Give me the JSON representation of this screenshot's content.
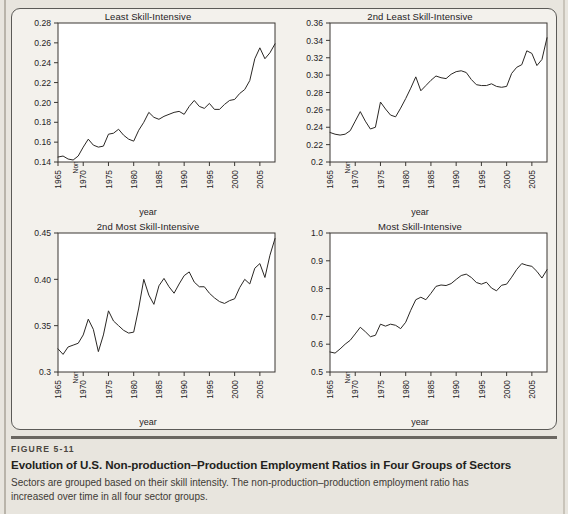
{
  "figure": {
    "number_label": "FIGURE 5-11",
    "title": "Evolution of U.S. Non-production–Production Employment Ratios in Four Groups of Sectors",
    "description": "Sectors are grouped based on their skill intensity. The non-production–production employment ratio has increased over time in all four sector groups."
  },
  "colors": {
    "page_background": "#e8e5de",
    "panel_background": "#f3f1ec",
    "plot_background": "#ffffff",
    "line": "#2a2724",
    "axis": "#3a3733",
    "rule": "#6a6660"
  },
  "shared": {
    "xlabel": "year",
    "ylabel": "Non-production–Production Employment",
    "xtick_labels": [
      "1965",
      "1970",
      "1975",
      "1980",
      "1985",
      "1990",
      "1995",
      "2000",
      "2005"
    ],
    "xtick_values": [
      1965,
      1970,
      1975,
      1980,
      1985,
      1990,
      1995,
      2000,
      2005
    ],
    "xlim": [
      1965,
      2008
    ]
  },
  "chart_data": [
    {
      "type": "line",
      "panel": "top-left",
      "title": "Least Skill-Intensive",
      "xlabel": "year",
      "ylabel": "Non-production–Production Employment",
      "xlim": [
        1965,
        2008
      ],
      "ylim": [
        0.14,
        0.28
      ],
      "ytick_labels": [
        "0.14",
        "0.16",
        "0.18",
        "0.20",
        "0.22",
        "0.24",
        "0.26",
        "0.28"
      ],
      "ytick_values": [
        0.14,
        0.16,
        0.18,
        0.2,
        0.22,
        0.24,
        0.26,
        0.28
      ],
      "grid": false,
      "legend": "none",
      "x": [
        1965,
        1966,
        1967,
        1968,
        1969,
        1970,
        1971,
        1972,
        1973,
        1974,
        1975,
        1976,
        1977,
        1978,
        1979,
        1980,
        1981,
        1982,
        1983,
        1984,
        1985,
        1986,
        1987,
        1988,
        1989,
        1990,
        1991,
        1992,
        1993,
        1994,
        1995,
        1996,
        1997,
        1998,
        1999,
        2000,
        2001,
        2002,
        2003,
        2004,
        2005,
        2006,
        2007,
        2008
      ],
      "values": [
        0.145,
        0.146,
        0.143,
        0.142,
        0.146,
        0.155,
        0.163,
        0.157,
        0.155,
        0.156,
        0.168,
        0.169,
        0.173,
        0.167,
        0.163,
        0.161,
        0.172,
        0.18,
        0.19,
        0.185,
        0.183,
        0.186,
        0.188,
        0.19,
        0.191,
        0.188,
        0.196,
        0.202,
        0.196,
        0.194,
        0.199,
        0.193,
        0.193,
        0.198,
        0.202,
        0.203,
        0.209,
        0.213,
        0.222,
        0.244,
        0.255,
        0.244,
        0.25,
        0.259
      ]
    },
    {
      "type": "line",
      "panel": "top-right",
      "title": "2nd Least Skill-Intensive",
      "xlabel": "year",
      "ylabel": "Non-production–Production Employment",
      "xlim": [
        1965,
        2008
      ],
      "ylim": [
        0.2,
        0.36
      ],
      "ytick_labels": [
        "0.2",
        "0.22",
        "0.24",
        "0.26",
        "0.28",
        "0.30",
        "0.32",
        "0.34",
        "0.36"
      ],
      "ytick_values": [
        0.2,
        0.22,
        0.24,
        0.26,
        0.28,
        0.3,
        0.32,
        0.34,
        0.36
      ],
      "grid": false,
      "legend": "none",
      "x": [
        1965,
        1966,
        1967,
        1968,
        1969,
        1970,
        1971,
        1972,
        1973,
        1974,
        1975,
        1976,
        1977,
        1978,
        1979,
        1980,
        1981,
        1982,
        1983,
        1984,
        1985,
        1986,
        1987,
        1988,
        1989,
        1990,
        1991,
        1992,
        1993,
        1994,
        1995,
        1996,
        1997,
        1998,
        1999,
        2000,
        2001,
        2002,
        2003,
        2004,
        2005,
        2006,
        2007,
        2008
      ],
      "values": [
        0.234,
        0.232,
        0.231,
        0.232,
        0.236,
        0.247,
        0.258,
        0.247,
        0.238,
        0.24,
        0.269,
        0.261,
        0.254,
        0.252,
        0.262,
        0.273,
        0.285,
        0.298,
        0.282,
        0.288,
        0.294,
        0.299,
        0.297,
        0.296,
        0.301,
        0.304,
        0.305,
        0.303,
        0.295,
        0.289,
        0.288,
        0.288,
        0.29,
        0.287,
        0.286,
        0.287,
        0.302,
        0.309,
        0.312,
        0.328,
        0.325,
        0.311,
        0.318,
        0.343
      ]
    },
    {
      "type": "line",
      "panel": "bottom-left",
      "title": "2nd Most Skill-Intensive",
      "xlabel": "year",
      "ylabel": "Non-production–Production Employment",
      "xlim": [
        1965,
        2008
      ],
      "ylim": [
        0.3,
        0.45
      ],
      "ytick_labels": [
        "0.3",
        "0.35",
        "0.40",
        "0.45"
      ],
      "ytick_values": [
        0.3,
        0.35,
        0.4,
        0.45
      ],
      "grid": false,
      "legend": "none",
      "x": [
        1965,
        1966,
        1967,
        1968,
        1969,
        1970,
        1971,
        1972,
        1973,
        1974,
        1975,
        1976,
        1977,
        1978,
        1979,
        1980,
        1981,
        1982,
        1983,
        1984,
        1985,
        1986,
        1987,
        1988,
        1989,
        1990,
        1991,
        1992,
        1993,
        1994,
        1995,
        1996,
        1997,
        1998,
        1999,
        2000,
        2001,
        2002,
        2003,
        2004,
        2005,
        2006,
        2007,
        2008
      ],
      "values": [
        0.325,
        0.319,
        0.327,
        0.329,
        0.331,
        0.34,
        0.357,
        0.346,
        0.322,
        0.34,
        0.366,
        0.355,
        0.35,
        0.345,
        0.342,
        0.343,
        0.369,
        0.4,
        0.383,
        0.373,
        0.393,
        0.401,
        0.392,
        0.385,
        0.395,
        0.404,
        0.408,
        0.397,
        0.392,
        0.392,
        0.385,
        0.38,
        0.376,
        0.374,
        0.377,
        0.379,
        0.391,
        0.4,
        0.395,
        0.412,
        0.417,
        0.402,
        0.426,
        0.444
      ]
    },
    {
      "type": "line",
      "panel": "bottom-right",
      "title": "Most Skill-Intensive",
      "xlabel": "year",
      "ylabel": "Non-production–Production Employment",
      "xlim": [
        1965,
        2008
      ],
      "ylim": [
        0.5,
        1.0
      ],
      "ytick_labels": [
        "0.5",
        "0.6",
        "0.7",
        "0.8",
        "0.9",
        "1.0"
      ],
      "ytick_values": [
        0.5,
        0.6,
        0.7,
        0.8,
        0.9,
        1.0
      ],
      "grid": false,
      "legend": "none",
      "x": [
        1965,
        1966,
        1967,
        1968,
        1969,
        1970,
        1971,
        1972,
        1973,
        1974,
        1975,
        1976,
        1977,
        1978,
        1979,
        1980,
        1981,
        1982,
        1983,
        1984,
        1985,
        1986,
        1987,
        1988,
        1989,
        1990,
        1991,
        1992,
        1993,
        1994,
        1995,
        1996,
        1997,
        1998,
        1999,
        2000,
        2001,
        2002,
        2003,
        2004,
        2005,
        2006,
        2007,
        2008
      ],
      "values": [
        0.572,
        0.568,
        0.583,
        0.6,
        0.614,
        0.637,
        0.661,
        0.645,
        0.627,
        0.632,
        0.672,
        0.665,
        0.672,
        0.668,
        0.656,
        0.679,
        0.722,
        0.76,
        0.769,
        0.76,
        0.783,
        0.808,
        0.813,
        0.811,
        0.818,
        0.833,
        0.847,
        0.852,
        0.84,
        0.822,
        0.816,
        0.823,
        0.802,
        0.792,
        0.812,
        0.816,
        0.841,
        0.869,
        0.89,
        0.884,
        0.88,
        0.862,
        0.838,
        0.868
      ]
    }
  ]
}
